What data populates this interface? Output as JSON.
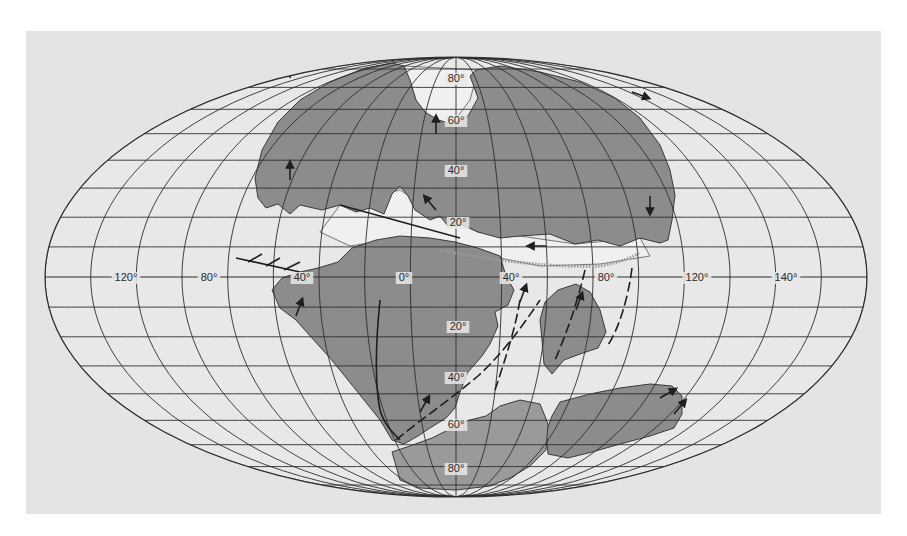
{
  "figure": {
    "type": "paleogeographic world map",
    "projection": "oval equal-area",
    "colors": {
      "page_background": "#ffffff",
      "panel_background": "#e4e4e4",
      "ocean_inside_oval": "#e8e8e8",
      "continental_shelf": "#f0f0f0",
      "land": "#8c8c8c",
      "antarctic_cap": "#9a9a9a",
      "grid_line": "#2e2e2e",
      "ridge_line": "#9a9a9a"
    }
  },
  "projection": {
    "cx": 456,
    "cy": 277,
    "rx": 411,
    "ry": 220,
    "parallels_every_deg": 10,
    "meridians_every_deg": 20
  },
  "labels": {
    "longitude": [
      {
        "text": "120°",
        "x": 126,
        "y": 281
      },
      {
        "text": "80°",
        "x": 209,
        "y": 281
      },
      {
        "text": "40°",
        "x": 302,
        "y": 281
      },
      {
        "text": "0°",
        "x": 404,
        "y": 281
      },
      {
        "text": "40°",
        "x": 511,
        "y": 281
      },
      {
        "text": "80°",
        "x": 606,
        "y": 281
      },
      {
        "text": "120°",
        "x": 697,
        "y": 281
      },
      {
        "text": "140°",
        "x": 786,
        "y": 281
      }
    ],
    "latitude": [
      {
        "text": "80°",
        "x": 456,
        "y": 82
      },
      {
        "text": "60°",
        "x": 456,
        "y": 124
      },
      {
        "text": "40°",
        "x": 456,
        "y": 174
      },
      {
        "text": "20°",
        "x": 458,
        "y": 226
      },
      {
        "text": "20°",
        "x": 458,
        "y": 330
      },
      {
        "text": "40°",
        "x": 456,
        "y": 381
      },
      {
        "text": "60°",
        "x": 456,
        "y": 428
      },
      {
        "text": "80°",
        "x": 456,
        "y": 472
      }
    ]
  },
  "landmasses": [
    {
      "name": "laurasia",
      "d": "M255 178 L262 150 L278 122 L300 100 L330 82 L365 68 L392 63 L404 66 L410 80 L416 100 L425 112 L438 120 L452 124 L468 116 L478 98 L470 76 L476 70 L500 66 L540 72 L580 82 L615 98 L640 118 L660 145 L670 170 L675 195 L672 220 L668 240 L660 243 L640 238 L620 246 L598 240 L575 244 L550 234 L520 236 L500 238 L478 232 L462 224 L448 226 L440 216 L430 220 L415 210 L408 196 L400 186 L392 194 L384 214 L370 208 L356 212 L340 205 L322 210 L300 205 L290 214 L278 204 L266 208 L258 198 Z"
    },
    {
      "name": "gondwana-west",
      "d": "M272 290 L282 278 L300 272 L318 268 L338 262 L352 248 L376 240 L400 236 L430 238 L455 242 L478 248 L500 256 L506 276 L514 290 L508 305 L495 312 L498 326 L490 344 L482 356 L468 372 L460 392 L455 408 L446 418 L430 428 L418 436 L404 444 L392 440 L380 420 L364 400 L348 380 L330 358 L312 338 L296 320 L280 308 Z"
    },
    {
      "name": "india-madagascar",
      "d": "M545 302 L558 290 L576 284 L590 292 L600 310 L606 332 L598 348 L580 354 L564 360 L552 374 L544 364 L542 340 L540 320 Z"
    },
    {
      "name": "australia-antarctica",
      "d": "M560 402 L590 394 L620 388 L650 384 L672 386 L682 396 L682 414 L674 428 L650 436 L620 444 L592 452 L568 458 L548 454 L546 432 L552 416 Z"
    },
    {
      "name": "antarctica",
      "d": "M392 452 L410 446 L432 438 L452 428 L470 420 L486 416 L500 406 L520 400 L540 404 L548 424 L546 450 L530 466 L510 478 L490 486 L456 490 L420 488 L400 480 Z"
    }
  ],
  "shelves": [
    {
      "name": "tethys-shelf",
      "d": "M340 205 L400 190 L440 216 L478 232 L520 236 L575 244 L640 238 L650 256 L600 264 L540 266 L500 258 L470 250 L440 244 L400 238 L350 246 L320 232 Z"
    },
    {
      "name": "north-atlantic-shelf",
      "d": "M404 66 L478 70 L470 100 L452 124 L430 118 L412 96 Z"
    }
  ],
  "ridges": [
    {
      "name": "tethys-ridge",
      "d": "M440 250 C500 262 560 268 600 266 C620 262 632 258 640 252"
    },
    {
      "name": "south-atlantic-rift",
      "d": "M396 440 C420 420 450 400 478 376 C500 356 520 330 540 300"
    },
    {
      "name": "indian-rift-1",
      "d": "M520 300 C515 330 505 360 495 390"
    },
    {
      "name": "indian-rift-2",
      "d": "M585 270 C578 300 568 330 555 360"
    },
    {
      "name": "east-rift",
      "d": "M632 268 C628 300 618 330 608 345"
    },
    {
      "name": "transform-west",
      "d": "M236 258 L300 272 M248 262 L262 254 M266 266 L280 258 M284 270 L300 262"
    },
    {
      "name": "caribbean-fault",
      "d": "M340 205 L460 238"
    },
    {
      "name": "andes-margin",
      "d": "M380 300 C376 340 374 380 380 410 C384 424 392 432 400 440"
    }
  ],
  "motion_arrows": [
    {
      "x": 290,
      "y": 180,
      "angle": -90
    },
    {
      "x": 436,
      "y": 134,
      "angle": -90
    },
    {
      "x": 436,
      "y": 210,
      "angle": -130
    },
    {
      "x": 650,
      "y": 196,
      "angle": 90
    },
    {
      "x": 546,
      "y": 246,
      "angle": 180
    },
    {
      "x": 296,
      "y": 316,
      "angle": -70
    },
    {
      "x": 520,
      "y": 302,
      "angle": -70
    },
    {
      "x": 576,
      "y": 310,
      "angle": -70
    },
    {
      "x": 420,
      "y": 412,
      "angle": -60
    },
    {
      "x": 660,
      "y": 398,
      "angle": -30
    },
    {
      "x": 674,
      "y": 414,
      "angle": -50
    },
    {
      "x": 290,
      "y": 78,
      "angle": -80
    },
    {
      "x": 632,
      "y": 92,
      "angle": 20
    }
  ]
}
